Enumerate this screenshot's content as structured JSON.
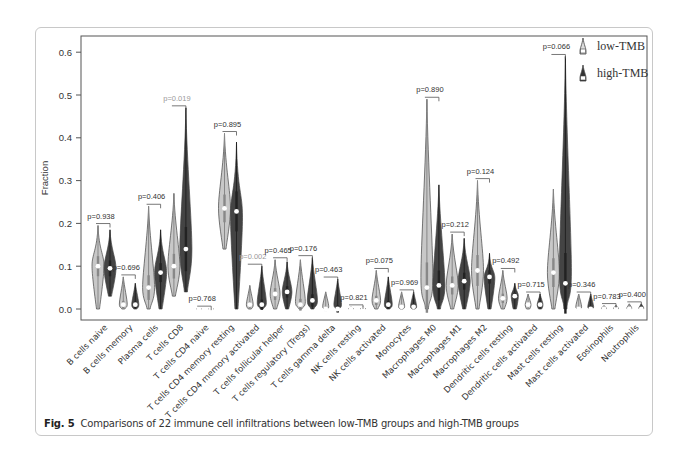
{
  "figure": {
    "caption_label": "Fig. 5",
    "caption_text": "Comparisons of 22 immune cell infiltrations between low-TMB groups and high-TMB groups"
  },
  "legend": {
    "items": [
      {
        "label": "low-TMB",
        "color": "#c8c8c8"
      },
      {
        "label": "high-TMB",
        "color": "#333333"
      }
    ],
    "position": "top-right"
  },
  "chart_data": {
    "type": "violin",
    "title": "",
    "xlabel": "",
    "ylabel": "Fraction",
    "ylim": [
      0,
      0.63
    ],
    "yticks": [
      0.0,
      0.1,
      0.2,
      0.3,
      0.4,
      0.5,
      0.6
    ],
    "grid": false,
    "legend_position": "top-right",
    "categories": [
      "B cells naive",
      "B cells memory",
      "Plasma cells",
      "T cells CD8",
      "T cells CD4 naive",
      "T cells CD4 memory resting",
      "T cells CD4 memory activated",
      "T cells follicular helper",
      "T cells regulatory (Tregs)",
      "T cells gamma delta",
      "NK cells resting",
      "NK cells activated",
      "Monocytes",
      "Macrophages M0",
      "Macrophages M1",
      "Macrophages M2",
      "Dendritic cells resting",
      "Dendritic cells activated",
      "Mast cells resting",
      "Mast cells activated",
      "Eosinophils",
      "Neutrophils"
    ],
    "p_values": [
      "p=0.938",
      "p=0.696",
      "p=0.406",
      "p=0.019",
      "p=0.768",
      "p=0.895",
      "p=0.002",
      "p=0.465",
      "p=0.176",
      "p=0.463",
      "p=0.821",
      "p=0.075",
      "p=0.969",
      "p=0.890",
      "p=0.212",
      "p=0.124",
      "p=0.492",
      "p=0.715",
      "p=0.066",
      "p=0.346",
      "p=0.783",
      "p=0.400"
    ],
    "p_significant": [
      false,
      false,
      false,
      true,
      false,
      false,
      true,
      false,
      false,
      false,
      false,
      false,
      false,
      false,
      false,
      false,
      false,
      false,
      false,
      false,
      false,
      false
    ],
    "series": [
      {
        "name": "low-TMB",
        "max": [
          0.195,
          0.075,
          0.24,
          0.27,
          0.002,
          0.41,
          0.055,
          0.115,
          0.115,
          0.04,
          0.005,
          0.09,
          0.04,
          0.49,
          0.175,
          0.3,
          0.09,
          0.035,
          0.28,
          0.035,
          0.008,
          0.012
        ],
        "min": [
          0.0,
          0.0,
          0.0,
          0.03,
          0.0,
          0.14,
          0.0,
          0.0,
          0.0,
          0.0,
          0.0,
          0.0,
          0.0,
          0.0,
          0.0,
          0.0,
          0.0,
          0.0,
          0.0,
          0.0,
          0.0,
          0.0
        ],
        "median": [
          0.1,
          0.01,
          0.05,
          0.1,
          0.0,
          0.235,
          0.01,
          0.035,
          0.01,
          0.0,
          0.0,
          0.02,
          0.005,
          0.05,
          0.055,
          0.09,
          0.025,
          0.01,
          0.085,
          0.0,
          0.0,
          0.0
        ]
      },
      {
        "name": "high-TMB",
        "max": [
          0.185,
          0.06,
          0.185,
          0.47,
          0.002,
          0.39,
          0.1,
          0.11,
          0.12,
          0.07,
          0.005,
          0.075,
          0.04,
          0.29,
          0.165,
          0.13,
          0.06,
          0.035,
          0.59,
          0.035,
          0.008,
          0.012
        ],
        "min": [
          0.03,
          0.0,
          0.0,
          0.04,
          0.0,
          0.0,
          0.0,
          0.0,
          0.0,
          0.0,
          0.0,
          0.0,
          0.0,
          0.0,
          0.0,
          0.0,
          0.0,
          0.0,
          0.0,
          0.0,
          0.0,
          0.0
        ],
        "median": [
          0.095,
          0.01,
          0.085,
          0.14,
          0.0,
          0.228,
          0.01,
          0.04,
          0.02,
          0.0,
          0.0,
          0.01,
          0.005,
          0.055,
          0.065,
          0.075,
          0.03,
          0.01,
          0.06,
          0.0,
          0.0,
          0.0
        ]
      }
    ]
  }
}
